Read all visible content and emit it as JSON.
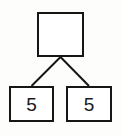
{
  "canvas": {
    "width": 122,
    "height": 136,
    "background_color": "#fdfdfc"
  },
  "diagram": {
    "type": "number-bond",
    "stroke_color": "#161616",
    "fill_color": "#ffffff",
    "text_color": "#1a1a1a",
    "stroke_width": 2,
    "nodes": {
      "whole": {
        "label": "",
        "role": "whole",
        "x": 37,
        "y": 12,
        "width": 47,
        "height": 45,
        "empty": true
      },
      "part_left": {
        "label": "5",
        "role": "part",
        "x": 9,
        "y": 86,
        "width": 45,
        "height": 36,
        "empty": false
      },
      "part_right": {
        "label": "5",
        "role": "part",
        "x": 66,
        "y": 86,
        "width": 46,
        "height": 36,
        "empty": false
      }
    },
    "connectors": [
      {
        "name": "whole-to-part-left",
        "from_x": 60.5,
        "from_y": 57,
        "to_x": 31.5,
        "to_y": 86
      },
      {
        "name": "whole-to-part-right",
        "from_x": 60.5,
        "from_y": 57,
        "to_x": 89,
        "to_y": 86
      }
    ]
  }
}
